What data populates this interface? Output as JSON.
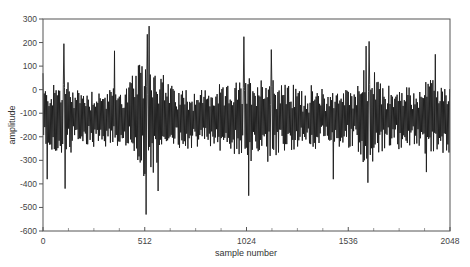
{
  "chart_data": {
    "type": "line",
    "title": "",
    "xlabel": "sample number",
    "ylabel": "amplitude",
    "xlim": [
      0,
      2048
    ],
    "ylim": [
      -600,
      300
    ],
    "x_ticks": [
      0,
      512,
      1024,
      1536,
      2048
    ],
    "x_tick_labels": [
      "0",
      "512",
      "1024",
      "1536",
      "2048"
    ],
    "x_minor_tick_step": 128,
    "y_ticks": [
      300,
      200,
      100,
      0,
      -100,
      -200,
      -300,
      -400,
      -500,
      -600
    ],
    "y_tick_labels": [
      "300",
      "200",
      "100",
      "0",
      "-100",
      "-200",
      "-300",
      "-400",
      "-500",
      "-600"
    ],
    "grid": false,
    "legend": null,
    "series": [
      {
        "name": "signal",
        "color": "#1a1a1a",
        "description": "oscillating signal of 2048 samples centered near -120, amplitude mostly between -350 and 150",
        "mean": -120,
        "keypoints": [
          {
            "x": 0,
            "y": 70
          },
          {
            "x": 20,
            "y": -380
          },
          {
            "x": 105,
            "y": 195
          },
          {
            "x": 110,
            "y": -420
          },
          {
            "x": 360,
            "y": 165
          },
          {
            "x": 525,
            "y": 235
          },
          {
            "x": 535,
            "y": 270
          },
          {
            "x": 520,
            "y": -530
          },
          {
            "x": 580,
            "y": -430
          },
          {
            "x": 1010,
            "y": 225
          },
          {
            "x": 1035,
            "y": -450
          },
          {
            "x": 1150,
            "y": 170
          },
          {
            "x": 1460,
            "y": -380
          },
          {
            "x": 1625,
            "y": 185
          },
          {
            "x": 1640,
            "y": 205
          },
          {
            "x": 1635,
            "y": -395
          },
          {
            "x": 1975,
            "y": 150
          },
          {
            "x": 1930,
            "y": -350
          },
          {
            "x": 2048,
            "y": 60
          }
        ]
      }
    ]
  },
  "labels": {
    "xlabel": "sample number",
    "ylabel": "amplitude"
  }
}
